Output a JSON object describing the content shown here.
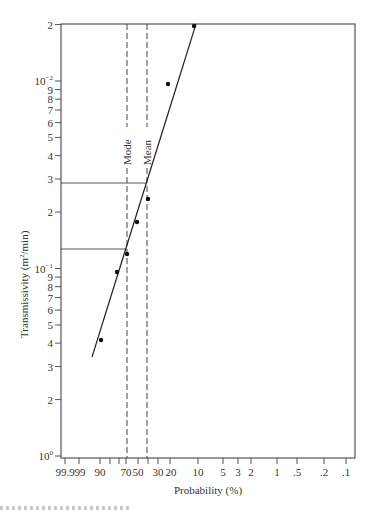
{
  "chart_data": {
    "type": "scatter",
    "title": "",
    "xlabel": "Probability (%)",
    "ylabel": "Transmissivity (m²/min)",
    "x_scale": "normal-probability (reversed)",
    "y_scale": "log",
    "x_ticks": [
      "99.9",
      "99",
      "90",
      "70",
      "50",
      "30",
      "20",
      "10",
      "5",
      "3",
      "2",
      "1",
      ".5",
      ".2",
      ".1"
    ],
    "y_tick_labels": [
      {
        "label": "2",
        "level": "top"
      },
      {
        "label": "10",
        "exp": "−2"
      },
      {
        "label": "9"
      },
      {
        "label": "8"
      },
      {
        "label": "7"
      },
      {
        "label": "6"
      },
      {
        "label": "5"
      },
      {
        "label": "4"
      },
      {
        "label": "3"
      },
      {
        "label": "2"
      },
      {
        "label": "10",
        "exp": "−1"
      },
      {
        "label": "9"
      },
      {
        "label": "8"
      },
      {
        "label": "7"
      },
      {
        "label": "6"
      },
      {
        "label": "5"
      },
      {
        "label": "4"
      },
      {
        "label": "3"
      },
      {
        "label": "2"
      },
      {
        "label": "10",
        "exp": "0"
      }
    ],
    "points": [
      {
        "probability": 12,
        "y_axis_reading": "2 (top)"
      },
      {
        "probability": 22,
        "y_axis_reading": "≈9.6 (below 10⁻²)"
      },
      {
        "probability": 38,
        "y_axis_reading": "≈2.3"
      },
      {
        "probability": 45,
        "y_axis_reading": "≈1.75"
      },
      {
        "probability": 62,
        "y_axis_reading": "≈1.2"
      },
      {
        "probability": 72,
        "y_axis_reading": "≈0.96 (≈9.6 below 10⁻¹)"
      },
      {
        "probability": 88,
        "y_axis_reading": "≈4.1"
      }
    ],
    "fit_line": {
      "from": {
        "probability": 95,
        "y_axis_reading": "≈3.4"
      },
      "to": {
        "probability": 12,
        "y_axis_reading": "2 (top)"
      }
    },
    "annotations": [
      {
        "label": "Mode",
        "type": "vertical-dashed",
        "probability": 65,
        "y_reading": "≈1.3"
      },
      {
        "label": "Mean",
        "type": "vertical-dashed",
        "probability": 40,
        "y_reading": "≈2.8"
      }
    ],
    "grid": false,
    "legend": "none"
  },
  "axis": {
    "xlabel": "Probability (%)",
    "ylabel_pre": "Transmissivity (m",
    "ylabel_sup": "2",
    "ylabel_post": "/min)"
  },
  "annotations": {
    "mode": "Mode",
    "mean": "Mean"
  }
}
